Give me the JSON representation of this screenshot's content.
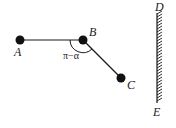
{
  "diagram": {
    "colors": {
      "ink": "#1a1a1a",
      "background": "#ffffff"
    },
    "points": {
      "A": {
        "label": "A",
        "x": 20,
        "y": 40
      },
      "B": {
        "label": "B",
        "x": 83,
        "y": 40
      },
      "C": {
        "label": "C",
        "x": 121,
        "y": 78
      }
    },
    "angle_label": "π−α",
    "wall": {
      "top_label": "D",
      "bottom_label": "E",
      "x": 157,
      "y_top": 13,
      "y_bottom": 103
    }
  }
}
